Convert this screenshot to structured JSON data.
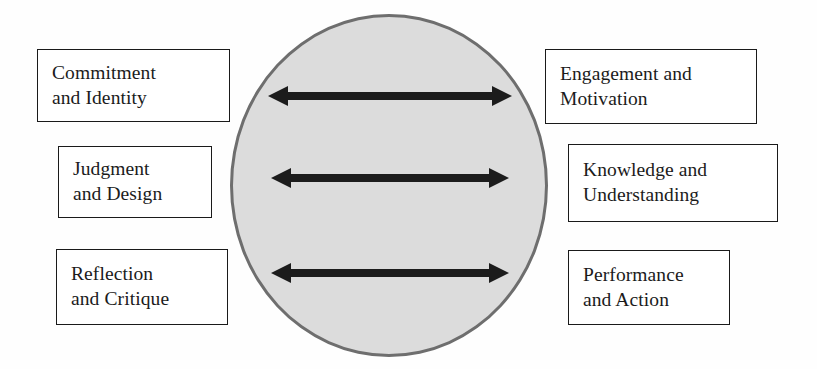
{
  "diagram": {
    "type": "relationship-diagram",
    "shapes": {
      "center_ellipse": {
        "name": "central-ellipse",
        "fill_color": "#dcdcdc",
        "border_color": "#6e6e6e",
        "label": ""
      }
    },
    "left_boxes": [
      {
        "name": "commitment-and-identity",
        "line1": "Commitment",
        "line2": "and Identity"
      },
      {
        "name": "judgment-and-design",
        "line1": "Judgment",
        "line2": "and Design"
      },
      {
        "name": "reflection-and-critique",
        "line1": "Reflection",
        "line2": "and Critique"
      }
    ],
    "right_boxes": [
      {
        "name": "engagement-and-motivation",
        "line1": "Engagement and",
        "line2": "Motivation"
      },
      {
        "name": "knowledge-and-understanding",
        "line1": "Knowledge and",
        "line2": "Understanding"
      },
      {
        "name": "performance-and-action",
        "line1": "Performance",
        "line2": "and Action"
      }
    ],
    "connectors": [
      {
        "name": "arrow-top",
        "style": "double-headed",
        "color": "#1c1c1c"
      },
      {
        "name": "arrow-middle",
        "style": "double-headed",
        "color": "#1c1c1c"
      },
      {
        "name": "arrow-bottom",
        "style": "double-headed",
        "color": "#1c1c1c"
      }
    ]
  }
}
